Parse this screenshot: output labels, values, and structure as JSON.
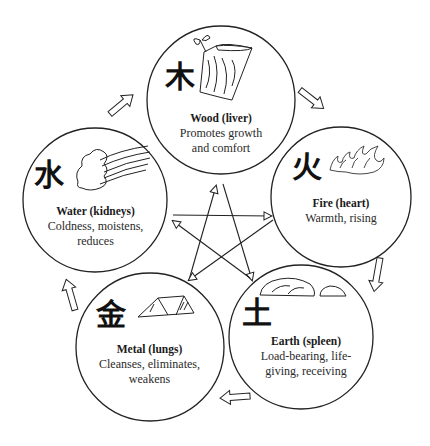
{
  "diagram": {
    "type": "five-elements-cycle",
    "colors": {
      "stroke": "#222222",
      "background": "#ffffff",
      "text": "#1a1a1a"
    },
    "elements": [
      {
        "id": "wood",
        "hanzi": "木",
        "title": "Wood (liver)",
        "desc": [
          "Promotes growth",
          "and comfort"
        ],
        "icon": "log-with-leaves-icon"
      },
      {
        "id": "fire",
        "hanzi": "火",
        "title": "Fire (heart)",
        "desc": [
          "Warmth, rising"
        ],
        "icon": "flames-icon"
      },
      {
        "id": "earth",
        "hanzi": "土",
        "title": "Earth (spleen)",
        "desc": [
          "Load-bearing, life-",
          "giving, receiving"
        ],
        "icon": "rocks-icon"
      },
      {
        "id": "metal",
        "hanzi": "金",
        "title": "Metal (lungs)",
        "desc": [
          "Cleanses, eliminates,",
          "weakens"
        ],
        "icon": "metal-ingot-icon"
      },
      {
        "id": "water",
        "hanzi": "水",
        "title": "Water (kidneys)",
        "desc": [
          "Coldness, moistens,",
          "reduces"
        ],
        "icon": "cloud-waves-icon"
      }
    ],
    "generating_cycle": [
      {
        "from": "wood",
        "to": "fire"
      },
      {
        "from": "fire",
        "to": "earth"
      },
      {
        "from": "earth",
        "to": "metal"
      },
      {
        "from": "metal",
        "to": "water"
      },
      {
        "from": "water",
        "to": "wood"
      }
    ],
    "controlling_cycle": [
      {
        "from": "wood",
        "to": "earth"
      },
      {
        "from": "earth",
        "to": "water"
      },
      {
        "from": "water",
        "to": "fire"
      },
      {
        "from": "fire",
        "to": "metal"
      },
      {
        "from": "metal",
        "to": "wood"
      }
    ]
  }
}
